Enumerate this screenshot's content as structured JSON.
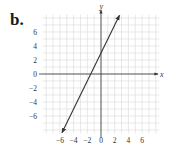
{
  "part_label": "b.",
  "chart_data": {
    "type": "line",
    "title": "",
    "xlabel": "x",
    "ylabel": "y",
    "xlim": [
      -8.5,
      8.5
    ],
    "ylim": [
      -8.5,
      8.5
    ],
    "grid": true,
    "x_ticks": [
      -6,
      -4,
      -2,
      0,
      2,
      4,
      6
    ],
    "y_ticks": [
      6,
      4,
      2,
      0,
      -2,
      -4,
      -6
    ],
    "x_tick_labels": [
      "−6",
      "−4",
      "−2",
      "0",
      "2",
      "4",
      "6"
    ],
    "y_tick_labels": [
      "6",
      "4",
      "2",
      "0",
      "−2",
      "−4",
      "−6"
    ],
    "series": [
      {
        "name": "line",
        "equation": "y = 2x + 3",
        "x": [
          -5.7,
          2.7
        ],
        "y": [
          -8.4,
          8.4
        ],
        "arrows_both_ends": true
      }
    ],
    "legend": null
  },
  "colors": {
    "grid": "#d8d8d8",
    "axis": "#333333",
    "line": "#333333"
  }
}
